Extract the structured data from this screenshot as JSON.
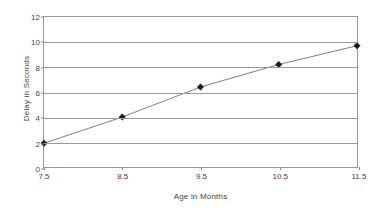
{
  "chart_data": {
    "type": "line",
    "title": "",
    "xlabel": "Age in Months",
    "ylabel": "Delay in Seconds",
    "categories": [
      "7.5",
      "8.5",
      "9.5",
      "10.5",
      "11.5"
    ],
    "x": [
      7.5,
      8.5,
      9.5,
      10.5,
      11.5
    ],
    "values": [
      1.9,
      4.0,
      6.4,
      8.2,
      9.7
    ],
    "series": [
      {
        "name": "Delay",
        "values": [
          1.9,
          4.0,
          6.4,
          8.2,
          9.7
        ]
      }
    ],
    "ylim": [
      0,
      12
    ],
    "ytick_step": 2,
    "yticks": [
      "0",
      "2",
      "4",
      "6",
      "8",
      "10",
      "12"
    ],
    "xticks": [
      "7.5",
      "8.5",
      "9.5",
      "10.5",
      "11.5"
    ],
    "grid": "horizontal",
    "legend": "none",
    "marker": "diamond",
    "colors": {
      "line": "#7d7d7d",
      "marker": "#1c1c1c",
      "grid": "#9a9a9a",
      "axis": "#9a9a9a",
      "text": "#444444",
      "background": "#ffffff"
    }
  }
}
